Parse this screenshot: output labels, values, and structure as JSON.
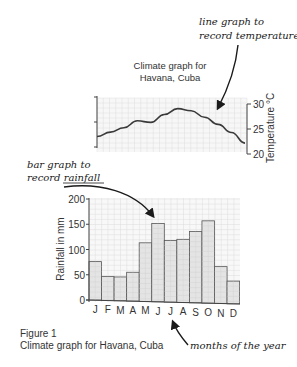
{
  "annotations": {
    "line_graph": [
      "line graph to",
      "record temperature"
    ],
    "bar_graph": [
      "bar graph to",
      "record rainfall"
    ],
    "months": "months of the year"
  },
  "figure": {
    "label": "Figure 1",
    "caption": "Climate graph for Havana, Cuba"
  },
  "colors": {
    "bar_fill": "#e4e4e4",
    "bar_stroke": "#555555",
    "grid": "#dcdcdc",
    "line": "#3a3a3a",
    "axis": "#444444"
  },
  "chart_data": [
    {
      "type": "line",
      "title": "Climate graph for Havana, Cuba",
      "title_lines": [
        "Climate graph for",
        "Havana, Cuba"
      ],
      "categories": [
        "J",
        "F",
        "M",
        "A",
        "M",
        "J",
        "J",
        "A",
        "S",
        "O",
        "N",
        "D"
      ],
      "series": [
        {
          "name": "Temperature",
          "values": [
            22.5,
            23.5,
            24.5,
            26.0,
            25.8,
            27.5,
            28.8,
            28.5,
            27.3,
            26.0,
            24.5,
            22.5
          ]
        }
      ],
      "ylabel": "Temperature °C",
      "yticks": [
        20,
        25,
        30
      ],
      "ylim": [
        20,
        30
      ],
      "axis_side": "right",
      "grid": true
    },
    {
      "type": "bar",
      "categories": [
        "J",
        "F",
        "M",
        "A",
        "M",
        "J",
        "J",
        "A",
        "S",
        "O",
        "N",
        "D"
      ],
      "values": [
        76,
        47,
        47,
        57,
        116,
        155,
        122,
        125,
        141,
        163,
        73,
        45
      ],
      "xlabel": "",
      "ylabel": "Rainfall in mm",
      "yticks": [
        0,
        50,
        100,
        150,
        200
      ],
      "ylim": [
        0,
        200
      ],
      "grid": true
    }
  ]
}
